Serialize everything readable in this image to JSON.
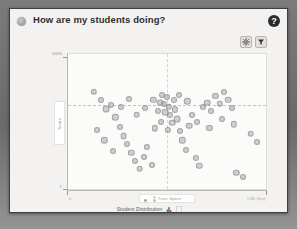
{
  "header": {
    "title": "How are my students doing?",
    "bullet_icon": "circle-avatar-icon",
    "help_icon": "help-question-icon",
    "help_label": "?"
  },
  "toolbar": {
    "settings_icon": "gear-icon",
    "settings_label": "Settings",
    "filter_icon": "filter-funnel-icon",
    "filter_label": "Filter"
  },
  "legend": {
    "label": "Student Distribution",
    "bar_toggle_icon": "bar-chart-icon",
    "table_toggle_icon": "table-view-icon",
    "page_dots": [
      "active",
      "inactive"
    ]
  },
  "chart_data": {
    "type": "scatter",
    "title": "How are my students doing?",
    "xlabel": "Time Spent",
    "ylabel": "Score",
    "x_tick_labels": [
      "0",
      "1.8K (hrs)"
    ],
    "y_tick_labels": [
      "100%",
      "0"
    ],
    "xlim": [
      0,
      1800
    ],
    "ylim": [
      0,
      100
    ],
    "grid": false,
    "legend_position": "bottom",
    "reference_lines": [
      {
        "orientation": "horizontal",
        "value": 62,
        "style": "dashed"
      },
      {
        "orientation": "vertical",
        "value": 900,
        "style": "dashed"
      }
    ],
    "series": [
      {
        "name": "Student Distribution",
        "color": "#969696",
        "points": [
          {
            "x": 235,
            "y": 72,
            "r": 3.2
          },
          {
            "x": 300,
            "y": 66,
            "r": 3.0
          },
          {
            "x": 345,
            "y": 59,
            "r": 3.4
          },
          {
            "x": 390,
            "y": 62,
            "r": 3.0
          },
          {
            "x": 430,
            "y": 53,
            "r": 3.2
          },
          {
            "x": 470,
            "y": 46,
            "r": 3.0
          },
          {
            "x": 505,
            "y": 39,
            "r": 3.4
          },
          {
            "x": 540,
            "y": 33,
            "r": 3.0
          },
          {
            "x": 575,
            "y": 27,
            "r": 3.2
          },
          {
            "x": 610,
            "y": 21,
            "r": 3.0
          },
          {
            "x": 650,
            "y": 15,
            "r": 3.3
          },
          {
            "x": 690,
            "y": 24,
            "r": 3.0
          },
          {
            "x": 720,
            "y": 31,
            "r": 3.1
          },
          {
            "x": 760,
            "y": 18,
            "r": 3.0
          },
          {
            "x": 790,
            "y": 45,
            "r": 3.2
          },
          {
            "x": 815,
            "y": 58,
            "r": 3.0
          },
          {
            "x": 835,
            "y": 64,
            "r": 3.4
          },
          {
            "x": 855,
            "y": 70,
            "r": 3.0
          },
          {
            "x": 870,
            "y": 63,
            "r": 3.1
          },
          {
            "x": 885,
            "y": 57,
            "r": 3.3
          },
          {
            "x": 900,
            "y": 68,
            "r": 3.0
          },
          {
            "x": 915,
            "y": 61,
            "r": 3.2
          },
          {
            "x": 930,
            "y": 55,
            "r": 3.0
          },
          {
            "x": 945,
            "y": 49,
            "r": 3.3
          },
          {
            "x": 960,
            "y": 66,
            "r": 3.0
          },
          {
            "x": 975,
            "y": 59,
            "r": 3.1
          },
          {
            "x": 995,
            "y": 52,
            "r": 3.4
          },
          {
            "x": 1015,
            "y": 43,
            "r": 3.0
          },
          {
            "x": 1040,
            "y": 36,
            "r": 3.2
          },
          {
            "x": 1070,
            "y": 29,
            "r": 3.0
          },
          {
            "x": 1100,
            "y": 47,
            "r": 3.3
          },
          {
            "x": 1130,
            "y": 55,
            "r": 3.0
          },
          {
            "x": 1160,
            "y": 23,
            "r": 3.1
          },
          {
            "x": 1195,
            "y": 17,
            "r": 3.2
          },
          {
            "x": 1230,
            "y": 61,
            "r": 3.0
          },
          {
            "x": 1265,
            "y": 64,
            "r": 3.3
          },
          {
            "x": 1300,
            "y": 58,
            "r": 3.0
          },
          {
            "x": 1340,
            "y": 69,
            "r": 3.1
          },
          {
            "x": 1380,
            "y": 63,
            "r": 3.2
          },
          {
            "x": 1420,
            "y": 72,
            "r": 3.0
          },
          {
            "x": 1455,
            "y": 66,
            "r": 3.3
          },
          {
            "x": 1490,
            "y": 60,
            "r": 3.0
          },
          {
            "x": 1530,
            "y": 12,
            "r": 3.2
          },
          {
            "x": 1590,
            "y": 9,
            "r": 3.0
          },
          {
            "x": 1660,
            "y": 41,
            "r": 3.3
          },
          {
            "x": 1720,
            "y": 35,
            "r": 3.0
          },
          {
            "x": 265,
            "y": 44,
            "r": 3.0
          },
          {
            "x": 330,
            "y": 36,
            "r": 3.2
          },
          {
            "x": 410,
            "y": 28,
            "r": 3.0
          },
          {
            "x": 480,
            "y": 61,
            "r": 3.1
          },
          {
            "x": 555,
            "y": 67,
            "r": 3.0
          },
          {
            "x": 625,
            "y": 55,
            "r": 3.3
          },
          {
            "x": 700,
            "y": 60,
            "r": 3.0
          },
          {
            "x": 775,
            "y": 66,
            "r": 3.2
          },
          {
            "x": 845,
            "y": 50,
            "r": 3.0
          },
          {
            "x": 905,
            "y": 44,
            "r": 3.1
          },
          {
            "x": 1005,
            "y": 70,
            "r": 3.0
          },
          {
            "x": 1085,
            "y": 65,
            "r": 3.2
          },
          {
            "x": 1175,
            "y": 50,
            "r": 3.0
          },
          {
            "x": 1285,
            "y": 45,
            "r": 3.1
          },
          {
            "x": 1400,
            "y": 52,
            "r": 3.0
          },
          {
            "x": 1505,
            "y": 48,
            "r": 3.2
          }
        ]
      }
    ]
  }
}
